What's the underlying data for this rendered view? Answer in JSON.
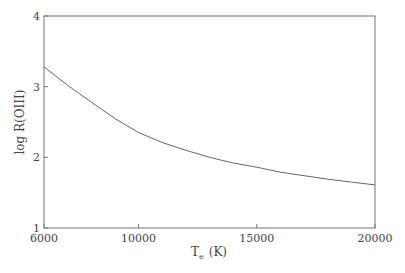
{
  "chart_data": {
    "type": "line",
    "title": "",
    "xlabel": "T_e (K)",
    "xlabel_main": "T",
    "xlabel_sub": "e",
    "xlabel_unit": "(K)",
    "ylabel": "log R(OIII)",
    "xlim": [
      6000,
      20000
    ],
    "ylim": [
      1,
      4
    ],
    "xticks": [
      6000,
      10000,
      15000,
      20000
    ],
    "yticks": [
      1,
      2,
      3,
      4
    ],
    "grid": false,
    "legend": null,
    "series": [
      {
        "name": "log R(OIII)",
        "x": [
          6000,
          7000,
          8000,
          9000,
          10000,
          11000,
          12000,
          13000,
          14000,
          15000,
          16000,
          17000,
          18000,
          19000,
          20000
        ],
        "y": [
          3.28,
          3.02,
          2.78,
          2.55,
          2.35,
          2.21,
          2.1,
          2.0,
          1.92,
          1.86,
          1.79,
          1.74,
          1.69,
          1.65,
          1.61
        ]
      }
    ]
  }
}
